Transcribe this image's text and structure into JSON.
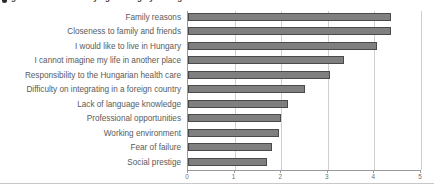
{
  "title_cutoff": {
    "text": "Figure: Reasons for staying in Hungary among medical students",
    "bullet_icon": "bullet-icon"
  },
  "chart_data": {
    "type": "bar",
    "orientation": "horizontal",
    "title": "",
    "xlabel": "",
    "ylabel": "",
    "xlim": [
      0,
      5
    ],
    "xticks": [
      "0",
      "1",
      "2",
      "3",
      "4",
      "5"
    ],
    "grid": true,
    "legend": "none",
    "bar_color": "#7f7f7f",
    "bar_edge_color": "#4a4a4a",
    "categories": [
      "Family reasons",
      "Closeness to family and friends",
      "I would like to live in Hungary",
      "I cannot imagine my life in another place",
      "Responsibility to the Hungarian health care",
      "Difficulty on integrating in a foreign country",
      "Lack of language knowledge",
      "Professional opportunities",
      "Working environment",
      "Fear of failure",
      "Social prestige"
    ],
    "values": [
      4.35,
      4.35,
      4.05,
      3.35,
      3.05,
      2.5,
      2.15,
      2.0,
      1.95,
      1.8,
      1.7
    ]
  }
}
